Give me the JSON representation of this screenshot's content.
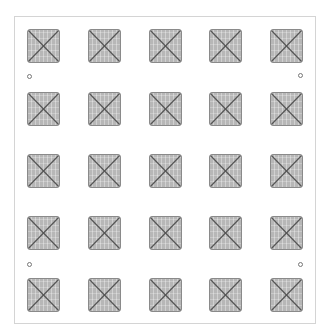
{
  "diagram": {
    "rows": 5,
    "columns": 5,
    "tile_glyph": "x-cross",
    "colors": {
      "frame_border": "#d4d4d4",
      "tile_fill": "#b7b7b7",
      "tile_border": "#8a8a8a",
      "cross_line": "#555555",
      "hole_border": "#777777"
    },
    "tiles": [
      {
        "row": 1,
        "col": 1
      },
      {
        "row": 1,
        "col": 2
      },
      {
        "row": 1,
        "col": 3
      },
      {
        "row": 1,
        "col": 4
      },
      {
        "row": 1,
        "col": 5
      },
      {
        "row": 2,
        "col": 1
      },
      {
        "row": 2,
        "col": 2
      },
      {
        "row": 2,
        "col": 3
      },
      {
        "row": 2,
        "col": 4
      },
      {
        "row": 2,
        "col": 5
      },
      {
        "row": 3,
        "col": 1
      },
      {
        "row": 3,
        "col": 2
      },
      {
        "row": 3,
        "col": 3
      },
      {
        "row": 3,
        "col": 4
      },
      {
        "row": 3,
        "col": 5
      },
      {
        "row": 4,
        "col": 1
      },
      {
        "row": 4,
        "col": 2
      },
      {
        "row": 4,
        "col": 3
      },
      {
        "row": 4,
        "col": 4
      },
      {
        "row": 4,
        "col": 5
      },
      {
        "row": 5,
        "col": 1
      },
      {
        "row": 5,
        "col": 2
      },
      {
        "row": 5,
        "col": 3
      },
      {
        "row": 5,
        "col": 4
      },
      {
        "row": 5,
        "col": 5
      }
    ],
    "holes": [
      {
        "position": "top-left"
      },
      {
        "position": "top-right"
      },
      {
        "position": "bottom-left"
      },
      {
        "position": "bottom-right"
      }
    ]
  }
}
